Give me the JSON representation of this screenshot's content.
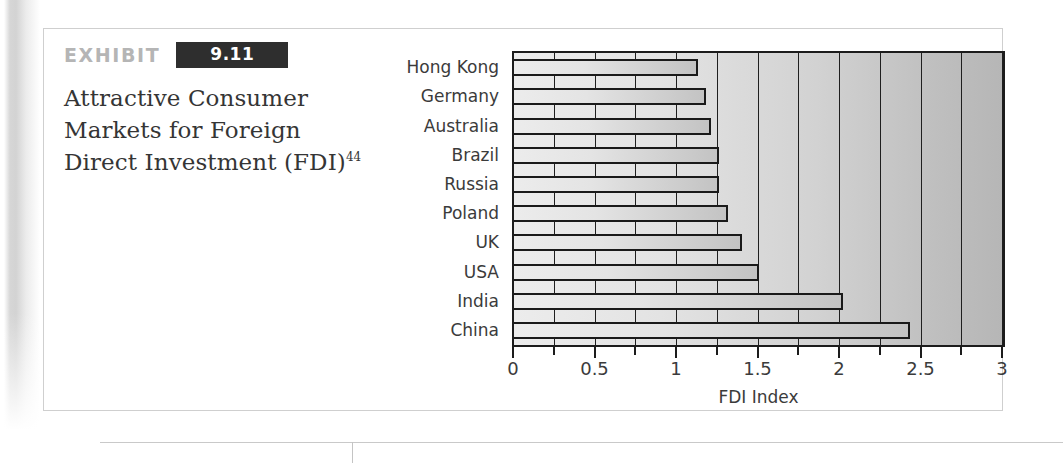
{
  "exhibit": {
    "label": "EXHIBIT",
    "number": "9.11",
    "title": "Attractive Consumer Markets for Foreign Direct Investment (FDI)",
    "title_superscript": "44"
  },
  "copyright": "© Cengage Learning",
  "chart_data": {
    "type": "bar",
    "orientation": "horizontal",
    "title": "Attractive Consumer Markets for Foreign Direct Investment (FDI)",
    "xlabel": "FDI Index",
    "ylabel": "",
    "xlim": [
      0,
      3
    ],
    "grid": true,
    "grid_step": 0.25,
    "legend": "none",
    "categories": [
      "Hong Kong",
      "Germany",
      "Australia",
      "Brazil",
      "Russia",
      "Poland",
      "UK",
      "USA",
      "India",
      "China"
    ],
    "values": [
      1.13,
      1.18,
      1.21,
      1.26,
      1.26,
      1.31,
      1.4,
      1.5,
      2.02,
      2.43
    ],
    "xticks": [
      0,
      0.25,
      0.5,
      0.75,
      1,
      1.25,
      1.5,
      1.75,
      2,
      2.25,
      2.5,
      2.75,
      3
    ],
    "xtick_labels": [
      "0",
      "",
      "0.5",
      "",
      "1",
      "",
      "1.5",
      "",
      "2",
      "",
      "2.5",
      "",
      "3"
    ]
  },
  "colors": {
    "bar_fill_light": "#ececec",
    "bar_fill_dark": "#c3c3c3",
    "bar_stroke": "#1a1a1a",
    "plot_bg_light": "#ececec",
    "plot_bg_dark": "#b6b6b6",
    "exhibit_label": "#b5b5b5",
    "exhibit_number_bg": "#2e2e2e",
    "text": "#3b3b3b"
  }
}
